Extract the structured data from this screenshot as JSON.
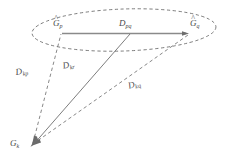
{
  "figure": {
    "background_color": "#ffffff",
    "line_color": "#5a5a5a",
    "solid_line_color": "#6e6e6e",
    "text_color": "#4a4a4a"
  },
  "labels": {
    "g_p": {
      "base": "G",
      "sub": "p",
      "accent": "^"
    },
    "g_q": {
      "base": "G",
      "sub": "q",
      "accent": "^"
    },
    "g_k": {
      "base": "G",
      "sub": "k",
      "accent": ""
    },
    "d_pq": {
      "base": "D",
      "sub": "pq",
      "accent": ""
    },
    "d_kp": {
      "base": "D",
      "sub": "kp",
      "accent": ""
    },
    "d_kr": {
      "base": "D",
      "sub": "kr",
      "accent": ""
    },
    "d_kq": {
      "base": "D",
      "sub": "kq",
      "accent": ""
    }
  },
  "geometry": {
    "ellipse": {
      "cx": 124,
      "cy": 30,
      "rx": 92,
      "ry": 21,
      "rotation": -2,
      "style": "dashed"
    },
    "points": {
      "g_p": {
        "x": 62,
        "y": 33
      },
      "g_q": {
        "x": 189,
        "y": 33
      },
      "g_k": {
        "x": 31,
        "y": 144
      },
      "d_pq_mid": {
        "x": 130,
        "y": 33
      }
    },
    "edges": [
      {
        "name": "pq-solid-arrow",
        "from": "g_p",
        "to": "g_q",
        "style": "solid",
        "arrow": "end"
      },
      {
        "name": "kp-dashed",
        "from": "g_k",
        "to": "g_p",
        "style": "dashed",
        "arrow": "end"
      },
      {
        "name": "kr-solid",
        "from": "g_k",
        "to": "d_pq_mid",
        "style": "solid",
        "arrow": "start"
      },
      {
        "name": "kq-dashed",
        "from": "g_k",
        "to": "g_q",
        "style": "dashed",
        "arrow": "start"
      }
    ]
  }
}
